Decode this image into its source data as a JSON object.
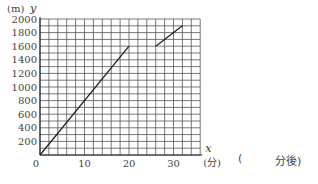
{
  "chart_data": {
    "type": "line",
    "title": "",
    "xlabel": "x",
    "xunit": "(分)",
    "ylabel": "y",
    "yunit": "(m)",
    "xlim": [
      0,
      36
    ],
    "ylim": [
      0,
      2000
    ],
    "grid": true,
    "x_grid_step": 2,
    "y_grid_step": 100,
    "x_ticks": [
      0,
      10,
      20,
      30
    ],
    "y_ticks": [
      200,
      400,
      600,
      800,
      1000,
      1200,
      1400,
      1600,
      1800,
      2000
    ],
    "origin_label": "0",
    "series": [
      {
        "name": "segment-1",
        "points": [
          [
            0,
            0
          ],
          [
            20,
            1600
          ]
        ]
      },
      {
        "name": "segment-2",
        "points": [
          [
            26,
            1600
          ],
          [
            32,
            1900
          ]
        ]
      }
    ],
    "legend": null
  },
  "answer_blank": {
    "open_paren": "(",
    "suffix": "分後)"
  }
}
